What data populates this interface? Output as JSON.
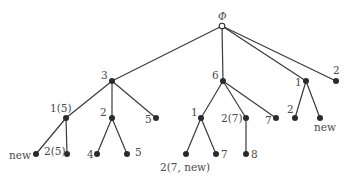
{
  "diagram": {
    "type": "tree",
    "root": {
      "id": "root",
      "label": "Φ",
      "x": 222,
      "y": 26,
      "hollow": true
    },
    "nodes": [
      {
        "id": "n3",
        "label": "3",
        "x": 112,
        "y": 81,
        "parent": "root",
        "lx": 101,
        "ly": 79
      },
      {
        "id": "n6",
        "label": "6",
        "x": 223,
        "y": 81,
        "parent": "root",
        "lx": 212,
        "ly": 79
      },
      {
        "id": "n1r",
        "label": "1",
        "x": 306,
        "y": 81,
        "parent": "root",
        "lx": 295,
        "ly": 86
      },
      {
        "id": "n2r",
        "label": "2",
        "x": 336,
        "y": 81,
        "parent": "root",
        "lx": 333,
        "ly": 74
      },
      {
        "id": "n15",
        "label": "1(5)",
        "x": 66,
        "y": 118,
        "parent": "n3",
        "lx": 50,
        "ly": 112
      },
      {
        "id": "n2a",
        "label": "2",
        "x": 112,
        "y": 118,
        "parent": "n3",
        "lx": 100,
        "ly": 116
      },
      {
        "id": "n5a",
        "label": "5",
        "x": 156,
        "y": 118,
        "parent": "n3",
        "lx": 145,
        "ly": 123
      },
      {
        "id": "n1b",
        "label": "1",
        "x": 201,
        "y": 118,
        "parent": "n6",
        "lx": 191,
        "ly": 116
      },
      {
        "id": "n27",
        "label": "2(7)",
        "x": 246,
        "y": 118,
        "parent": "n6",
        "lx": 221,
        "ly": 122
      },
      {
        "id": "n7a",
        "label": "7",
        "x": 276,
        "y": 118,
        "parent": "n6",
        "lx": 265,
        "ly": 124
      },
      {
        "id": "n2c",
        "label": "2",
        "x": 295,
        "y": 118,
        "parent": "n1r",
        "lx": 287,
        "ly": 113
      },
      {
        "id": "nnew1",
        "label": "new",
        "x": 320,
        "y": 118,
        "parent": "n1r",
        "lx": 314,
        "ly": 131
      },
      {
        "id": "nnew2",
        "label": "new",
        "x": 36,
        "y": 154,
        "parent": "n15",
        "lx": 9,
        "ly": 159
      },
      {
        "id": "n25",
        "label": "2(5)",
        "x": 67,
        "y": 154,
        "parent": "n15",
        "lx": 44,
        "ly": 155
      },
      {
        "id": "n4",
        "label": "4",
        "x": 97,
        "y": 154,
        "parent": "n2a",
        "lx": 87,
        "ly": 158
      },
      {
        "id": "n5b",
        "label": "5",
        "x": 127,
        "y": 154,
        "parent": "n2a",
        "lx": 135,
        "ly": 156
      },
      {
        "id": "n27new",
        "label": "2(7, new)",
        "x": 186,
        "y": 154,
        "parent": "n1b",
        "lx": 160,
        "ly": 171
      },
      {
        "id": "n7b",
        "label": "7",
        "x": 216,
        "y": 154,
        "parent": "n1b",
        "lx": 221,
        "ly": 158
      },
      {
        "id": "n8",
        "label": "8",
        "x": 246,
        "y": 154,
        "parent": "n27",
        "lx": 251,
        "ly": 158
      }
    ]
  }
}
